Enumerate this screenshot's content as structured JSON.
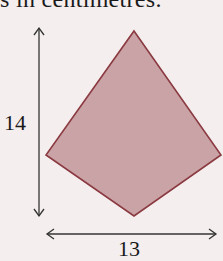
{
  "header": {
    "text": "s in centimetres."
  },
  "diagram": {
    "shape": "kite",
    "fill_color": "#caa3a6",
    "stroke_color": "#8a3a40",
    "height_label": "14",
    "width_label": "13",
    "vertices": {
      "top": [
        134,
        31
      ],
      "right": [
        221,
        155
      ],
      "bottom": [
        134,
        216
      ],
      "left": [
        46,
        155
      ]
    }
  }
}
